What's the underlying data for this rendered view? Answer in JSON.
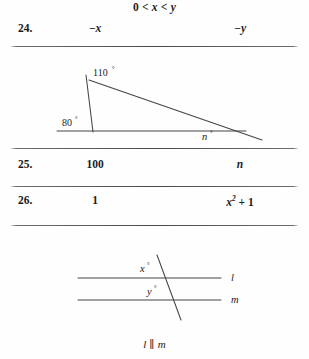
{
  "page": {
    "background_color": "#fefefe",
    "text_color": "#1c1c1c",
    "rule_color": "#4a4a4a"
  },
  "header": {
    "condition": "0 < x < y"
  },
  "rows": [
    {
      "number": "24.",
      "column_a": "−x",
      "column_b": "−y"
    },
    {
      "number": "25.",
      "column_a": "100",
      "column_b": "n"
    },
    {
      "number": "26.",
      "column_a": "1",
      "column_b": "x² + 1"
    }
  ],
  "figures": [
    {
      "id": "triangle-figure",
      "type": "triangle-with-exterior-angle",
      "labels": {
        "angle_top": "110",
        "angle_left": "80",
        "angle_right": "n",
        "degree_symbol": "°"
      }
    },
    {
      "id": "parallel-lines-figure",
      "type": "parallel-lines-with-transversal",
      "labels": {
        "angle_upper": "x",
        "angle_lower": "y",
        "line_upper": "l",
        "line_lower": "m",
        "degree_symbol": "°"
      },
      "caption": "l ∥ m"
    }
  ],
  "caption": {
    "line_upper": "l",
    "parallel_symbol": "∥",
    "line_lower": "m"
  }
}
